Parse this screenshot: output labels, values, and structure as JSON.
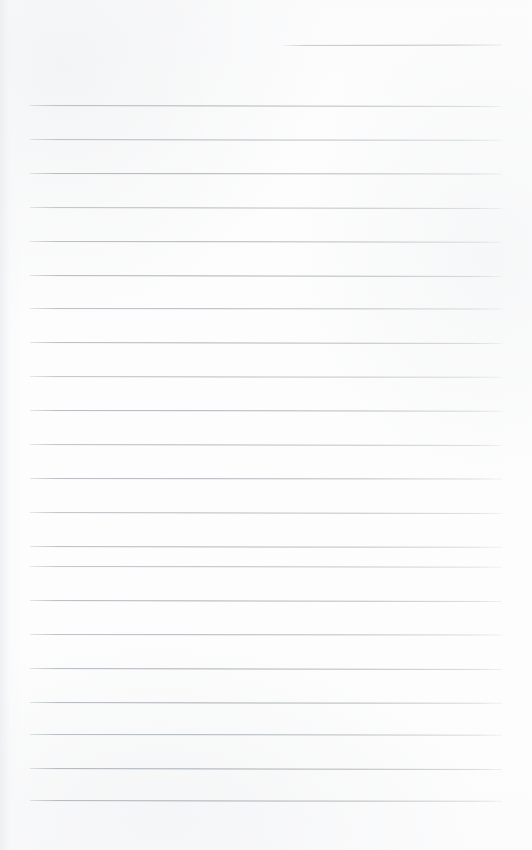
{
  "document": {
    "kind": "lined-paper-scan",
    "title": "Blank lined notebook page",
    "page_width": 532,
    "page_height": 850,
    "has_text": false,
    "text_content": "",
    "paper_color": "#fdfdfd",
    "rule_color": "#a8adb3"
  },
  "ruling": {
    "line_count": 23,
    "full_line_count": 22,
    "partial_line_count": 1,
    "line_spacing_px": 34,
    "left_margin_px": 30,
    "right_margin_px": 30,
    "line_thickness_px": 1,
    "first_line_y": 45,
    "last_line_y": 800
  },
  "lines": [
    {
      "id": "rule-0",
      "y": 45,
      "x": 283,
      "width": 219,
      "opacity": 0.8,
      "slope": -0.5,
      "type": "partial"
    },
    {
      "id": "rule-1",
      "y": 105,
      "x": 30,
      "width": 472,
      "opacity": 0.85,
      "slope": 1.0,
      "type": "full"
    },
    {
      "id": "rule-2",
      "y": 139,
      "x": 30,
      "width": 472,
      "opacity": 0.8,
      "slope": 0.8,
      "type": "full"
    },
    {
      "id": "rule-3",
      "y": 173,
      "x": 30,
      "width": 472,
      "opacity": 0.88,
      "slope": 0.6,
      "type": "full"
    },
    {
      "id": "rule-4",
      "y": 207,
      "x": 30,
      "width": 472,
      "opacity": 0.78,
      "slope": 1.0,
      "type": "full"
    },
    {
      "id": "rule-5",
      "y": 241,
      "x": 30,
      "width": 472,
      "opacity": 0.84,
      "slope": 0.7,
      "type": "full"
    },
    {
      "id": "rule-6",
      "y": 275,
      "x": 30,
      "width": 472,
      "opacity": 0.9,
      "slope": 0.9,
      "type": "full"
    },
    {
      "id": "rule-7",
      "y": 308,
      "x": 30,
      "width": 472,
      "opacity": 0.82,
      "slope": 0.6,
      "type": "full"
    },
    {
      "id": "rule-8",
      "y": 342,
      "x": 30,
      "width": 472,
      "opacity": 0.86,
      "slope": 1.0,
      "type": "full"
    },
    {
      "id": "rule-9",
      "y": 376,
      "x": 30,
      "width": 472,
      "opacity": 0.76,
      "slope": 0.8,
      "type": "full"
    },
    {
      "id": "rule-10",
      "y": 410,
      "x": 30,
      "width": 472,
      "opacity": 0.88,
      "slope": 0.7,
      "type": "full"
    },
    {
      "id": "rule-11",
      "y": 444,
      "x": 30,
      "width": 472,
      "opacity": 0.8,
      "slope": 0.9,
      "type": "full"
    },
    {
      "id": "rule-12",
      "y": 478,
      "x": 30,
      "width": 472,
      "opacity": 0.86,
      "slope": 0.6,
      "type": "full"
    },
    {
      "id": "rule-13",
      "y": 512,
      "x": 30,
      "width": 472,
      "opacity": 0.78,
      "slope": 1.0,
      "type": "full"
    },
    {
      "id": "rule-14",
      "y": 546,
      "x": 30,
      "width": 472,
      "opacity": 0.84,
      "slope": 0.8,
      "type": "full"
    },
    {
      "id": "rule-15",
      "y": 566,
      "x": 30,
      "width": 472,
      "opacity": 0.74,
      "slope": 0.7,
      "type": "full"
    },
    {
      "id": "rule-16",
      "y": 600,
      "x": 30,
      "width": 472,
      "opacity": 0.88,
      "slope": 0.9,
      "type": "full"
    },
    {
      "id": "rule-17",
      "y": 634,
      "x": 30,
      "width": 472,
      "opacity": 0.82,
      "slope": 0.6,
      "type": "full"
    },
    {
      "id": "rule-18",
      "y": 668,
      "x": 30,
      "width": 472,
      "opacity": 0.9,
      "slope": 1.0,
      "type": "full"
    },
    {
      "id": "rule-19",
      "y": 702,
      "x": 30,
      "width": 472,
      "opacity": 0.92,
      "slope": 0.8,
      "type": "full"
    },
    {
      "id": "rule-20",
      "y": 734,
      "x": 30,
      "width": 472,
      "opacity": 0.86,
      "slope": 0.7,
      "type": "full"
    },
    {
      "id": "rule-21",
      "y": 768,
      "x": 30,
      "width": 472,
      "opacity": 0.94,
      "slope": 0.9,
      "type": "full"
    },
    {
      "id": "rule-22",
      "y": 800,
      "x": 30,
      "width": 472,
      "opacity": 0.92,
      "slope": 0.8,
      "type": "full"
    }
  ]
}
